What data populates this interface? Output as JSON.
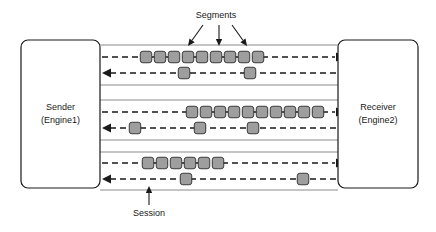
{
  "diagram": {
    "background": "#ffffff",
    "width": 436,
    "height": 232,
    "colors": {
      "segment_fill": "#9e9e9e",
      "segment_stroke": "#2b2b2b",
      "line": "#1a1a1a",
      "pipe_wall": "#8c8c8c",
      "box_fill": "#ffffff"
    },
    "nodes": [
      {
        "id": "sender",
        "name": "Sender",
        "sublabel": "(Engine1)",
        "x": 21,
        "y": 40,
        "width": 79,
        "height": 148
      },
      {
        "id": "receiver",
        "name": "Receiver",
        "sublabel": "(Engine2)",
        "x": 338,
        "y": 40,
        "width": 80,
        "height": 148
      }
    ],
    "callouts": [
      {
        "id": "segments",
        "label": "Segments",
        "text_x": 216,
        "text_y": 16,
        "arrows": [
          {
            "x1": 203,
            "y1": 25,
            "x2": 188,
            "y2": 46
          },
          {
            "x1": 219,
            "y1": 25,
            "x2": 219,
            "y2": 46
          },
          {
            "x1": 232,
            "y1": 25,
            "x2": 247,
            "y2": 46
          }
        ]
      },
      {
        "id": "session",
        "label": "Session",
        "text_x": 149,
        "text_y": 214,
        "arrows": [
          {
            "x1": 149,
            "y1": 205,
            "x2": 149,
            "y2": 186
          }
        ]
      }
    ],
    "sessions": [
      {
        "id": "session-1",
        "pipe_top": 45,
        "pipe_bottom": 85,
        "forward_y": 57,
        "reverse_y": 73,
        "forward_arrow_x": 336,
        "reverse_arrow_x": 102,
        "forward_segments": [
          146,
          160,
          174,
          188,
          202,
          216,
          230,
          244,
          258
        ],
        "reverse_segments": [
          184,
          250
        ]
      },
      {
        "id": "session-2",
        "pipe_top": 100,
        "pipe_bottom": 140,
        "forward_y": 112,
        "reverse_y": 128,
        "forward_arrow_x": 336,
        "reverse_arrow_x": 102,
        "forward_segments": [
          192,
          206,
          220,
          234,
          248,
          262,
          276,
          290,
          304,
          318
        ],
        "reverse_segments": [
          135,
          200,
          253
        ]
      },
      {
        "id": "session-3",
        "pipe_top": 152,
        "pipe_bottom": 190,
        "forward_y": 163,
        "reverse_y": 179,
        "forward_arrow_x": 336,
        "reverse_arrow_x": 102,
        "forward_segments": [
          148,
          162,
          176,
          190,
          204,
          218
        ],
        "reverse_segments": [
          186,
          303
        ]
      }
    ]
  }
}
